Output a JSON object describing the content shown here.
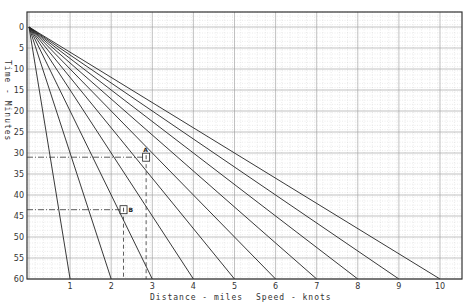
{
  "chart_data": {
    "type": "line",
    "title": "",
    "xlabel": "Distance - miles",
    "xlabel2": "Speed - knots",
    "ylabel": "Time - Minutes",
    "x_ticks": [
      1,
      2,
      3,
      4,
      5,
      6,
      7,
      8,
      9,
      10
    ],
    "y_ticks": [
      0,
      5,
      10,
      15,
      20,
      25,
      30,
      35,
      40,
      45,
      50,
      55,
      60
    ],
    "xlim": [
      0,
      10.5
    ],
    "ylim": [
      60,
      0
    ],
    "grid": true,
    "series": [
      {
        "name": "1 knot",
        "points": [
          [
            0,
            0
          ],
          [
            1,
            60
          ]
        ]
      },
      {
        "name": "2 knots",
        "points": [
          [
            0,
            0
          ],
          [
            2,
            60
          ]
        ]
      },
      {
        "name": "3 knots",
        "points": [
          [
            0,
            0
          ],
          [
            3,
            60
          ]
        ]
      },
      {
        "name": "4 knots",
        "points": [
          [
            0,
            0
          ],
          [
            4,
            60
          ]
        ]
      },
      {
        "name": "5 knots",
        "points": [
          [
            0,
            0
          ],
          [
            5,
            60
          ]
        ]
      },
      {
        "name": "6 knots",
        "points": [
          [
            0,
            0
          ],
          [
            6,
            60
          ]
        ]
      },
      {
        "name": "7 knots",
        "points": [
          [
            0,
            0
          ],
          [
            7,
            60
          ]
        ]
      },
      {
        "name": "8 knots",
        "points": [
          [
            0,
            0
          ],
          [
            8,
            60
          ]
        ]
      },
      {
        "name": "9 knots",
        "points": [
          [
            0,
            0
          ],
          [
            9,
            60
          ]
        ]
      },
      {
        "name": "10 knots",
        "points": [
          [
            0,
            0
          ],
          [
            10,
            60
          ]
        ]
      }
    ],
    "annotations": [
      {
        "label": "A",
        "distance": 2.85,
        "time": 31
      },
      {
        "label": "B",
        "distance": 2.3,
        "time": 43.5
      }
    ]
  },
  "labels": {
    "ylabel": "Time - Minutes",
    "xlabel": "Distance - miles",
    "xlabel2": "Speed - knots",
    "markerA": "A",
    "markerB": "B"
  }
}
